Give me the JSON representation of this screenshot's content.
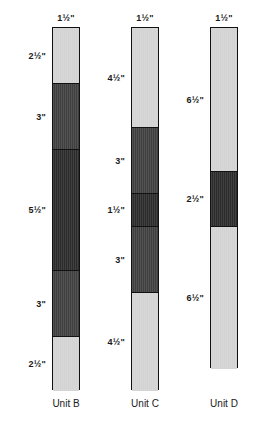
{
  "figure": {
    "measurement_unit": "inches",
    "colors": {
      "light": "#d3d3d3",
      "mid": "#3f3f3f",
      "dark": "#2b2b2b",
      "outline": "#111111",
      "background": "#ffffff",
      "text": "#1a1a1a"
    },
    "scale_px_per_inch": 22
  },
  "chart_data": {
    "type": "bar",
    "title": "",
    "xlabel": "",
    "ylabel": "",
    "orientation": "vertical-stacked",
    "categories": [
      "Unit B",
      "Unit C",
      "Unit D"
    ],
    "series": [
      {
        "name": "Unit B",
        "width_label": "1½\"",
        "width_in": 1.5,
        "total_in": 16.5,
        "segments": [
          {
            "label": "2½\"",
            "value": 2.5,
            "shade": "light"
          },
          {
            "label": "3\"",
            "value": 3.0,
            "shade": "mid"
          },
          {
            "label": "5½\"",
            "value": 5.5,
            "shade": "dark"
          },
          {
            "label": "3\"",
            "value": 3.0,
            "shade": "mid"
          },
          {
            "label": "2½\"",
            "value": 2.5,
            "shade": "light"
          }
        ]
      },
      {
        "name": "Unit C",
        "width_label": "1½\"",
        "width_in": 1.5,
        "total_in": 16.5,
        "segments": [
          {
            "label": "4½\"",
            "value": 4.5,
            "shade": "light"
          },
          {
            "label": "3\"",
            "value": 3.0,
            "shade": "mid"
          },
          {
            "label": "1½\"",
            "value": 1.5,
            "shade": "dark"
          },
          {
            "label": "3\"",
            "value": 3.0,
            "shade": "mid"
          },
          {
            "label": "4½\"",
            "value": 4.5,
            "shade": "light"
          }
        ]
      },
      {
        "name": "Unit D",
        "width_label": "1½\"",
        "width_in": 1.5,
        "total_in": 15.5,
        "segments": [
          {
            "label": "6½\"",
            "value": 6.5,
            "shade": "light"
          },
          {
            "label": "2½\"",
            "value": 2.5,
            "shade": "dark"
          },
          {
            "label": "6½\"",
            "value": 6.5,
            "shade": "light"
          }
        ]
      }
    ]
  },
  "columns": [
    {
      "caption": "Unit B",
      "width_label": "1½\"",
      "bar_left_px": 52,
      "bar_top_px": 27,
      "label_center_px": 66,
      "caption_left_px": 32,
      "caption_width_px": 68
    },
    {
      "caption": "Unit C",
      "width_label": "1½\"",
      "bar_left_px": 131,
      "bar_top_px": 27,
      "label_center_px": 145,
      "caption_left_px": 111,
      "caption_width_px": 68
    },
    {
      "caption": "Unit D",
      "width_label": "1½\"",
      "bar_left_px": 210,
      "bar_top_px": 27,
      "label_center_px": 224,
      "caption_left_px": 190,
      "caption_width_px": 68
    }
  ]
}
